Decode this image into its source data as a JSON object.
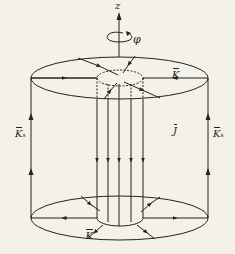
{
  "diagram": {
    "axis_label": "z",
    "rotation_label": "φ",
    "surface_current_top_label": "K",
    "surface_current_bottom_label": "K",
    "volume_current_label": "J",
    "side_current_left_label": "K",
    "side_current_left_subscript": "s",
    "side_current_right_label": "K",
    "side_current_right_subscript": "s",
    "colors": {
      "stroke": "#222222",
      "background": "#f4f1e8"
    }
  }
}
